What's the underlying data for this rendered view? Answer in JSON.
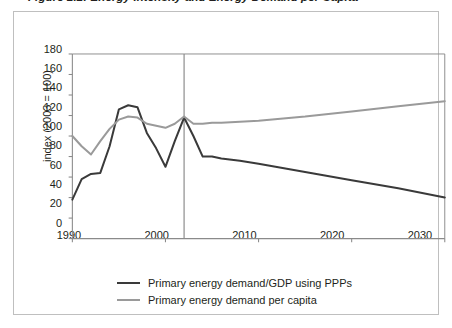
{
  "figure": {
    "title": "Figure 2.2: Energy Intensity and Energy Demand per Capita"
  },
  "chart_data": {
    "type": "line",
    "title": "",
    "xlabel": "",
    "ylabel": "index (2003 = 100)",
    "xlim": [
      1990,
      2030
    ],
    "ylim": [
      0,
      180
    ],
    "xticks": [
      "1990",
      "2000",
      "2010",
      "2020",
      "2030"
    ],
    "xtick_values": [
      1990,
      2000,
      2010,
      2020,
      2030
    ],
    "yticks": [
      "0",
      "20",
      "40",
      "60",
      "80",
      "100",
      "120",
      "140",
      "160",
      "180"
    ],
    "ytick_values": [
      0,
      20,
      40,
      60,
      80,
      100,
      120,
      140,
      160,
      180
    ],
    "grid": false,
    "legend_position": "bottom",
    "projection_divider_x": 2002,
    "colors": {
      "series_1": "#3a3a3a",
      "series_2": "#9a9a9a",
      "axis": "#8a8a8a",
      "divider": "#8a8a8a",
      "frame": "#bfbfbf",
      "text": "#231f20"
    },
    "series": [
      {
        "name": "Primary energy demand/GDP using PPPs",
        "color": "#3a3a3a",
        "x": [
          1990,
          1991,
          1992,
          1993,
          1994,
          1995,
          1996,
          1997,
          1998,
          1999,
          2000,
          2001,
          2002,
          2003,
          2004,
          2005,
          2006,
          2008,
          2010,
          2015,
          2020,
          2025,
          2030
        ],
        "values": [
          38,
          58,
          63,
          64,
          90,
          126,
          130,
          128,
          103,
          88,
          70,
          95,
          118,
          100,
          80,
          80,
          78,
          76,
          73,
          65,
          57,
          49,
          40
        ]
      },
      {
        "name": "Primary energy demand per capita",
        "color": "#9a9a9a",
        "x": [
          1990,
          1991,
          1992,
          1993,
          1994,
          1995,
          1996,
          1997,
          1998,
          1999,
          2000,
          2001,
          2002,
          2003,
          2004,
          2005,
          2006,
          2008,
          2010,
          2015,
          2020,
          2025,
          2030
        ],
        "values": [
          100,
          90,
          82,
          95,
          107,
          116,
          119,
          118,
          112,
          110,
          108,
          112,
          119,
          112,
          112,
          113,
          113,
          114,
          115,
          119,
          124,
          129,
          134
        ]
      }
    ]
  },
  "legend": {
    "items": [
      {
        "label": "Primary energy demand/GDP using PPPs",
        "color": "#3a3a3a"
      },
      {
        "label": "Primary energy demand per capita",
        "color": "#9a9a9a"
      }
    ]
  }
}
